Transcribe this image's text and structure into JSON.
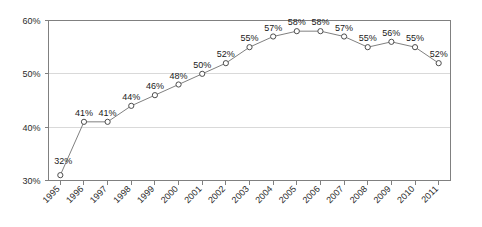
{
  "chart_data": {
    "type": "line",
    "title": "",
    "subtitle": "",
    "xlabel": "",
    "ylabel": "",
    "categories": [
      "1995",
      "1996",
      "1997",
      "1998",
      "1999",
      "2000",
      "2001",
      "2002",
      "2003",
      "2004",
      "2005",
      "2006",
      "2007",
      "2008",
      "2009",
      "2010",
      "2011"
    ],
    "values": [
      32,
      41,
      41,
      44,
      46,
      48,
      50,
      52,
      55,
      57,
      58,
      58,
      57,
      55,
      56,
      55,
      52
    ],
    "point_labels": [
      "32%",
      "41%",
      "41%",
      "44%",
      "46%",
      "48%",
      "50%",
      "52%",
      "55%",
      "57%",
      "58%",
      "58%",
      "57%",
      "55%",
      "56%",
      "55%",
      "52%"
    ],
    "plotted_values": [
      31,
      41,
      41,
      44,
      46,
      48,
      50,
      52,
      55,
      57,
      58,
      58,
      57,
      55,
      56,
      55,
      52
    ],
    "ylim": [
      30,
      60
    ],
    "yticks": [
      30,
      40,
      50,
      60
    ],
    "ytick_labels": [
      "30%",
      "40%",
      "50%",
      "60%"
    ],
    "grid": true,
    "legend": "none",
    "series": [
      {
        "name": "",
        "values": [
          32,
          41,
          41,
          44,
          46,
          48,
          50,
          52,
          55,
          57,
          58,
          58,
          57,
          55,
          56,
          55,
          52
        ],
        "line_color": "#808080",
        "marker": "open-circle",
        "marker_edge_color": "#555555",
        "marker_fill_color": "#ffffff"
      }
    ],
    "colors": {
      "axis": "#808080",
      "grid": "#d9d9d9",
      "line": "#808080",
      "marker_edge": "#4d4d4d",
      "text": "#2b2b2b",
      "background": "#ffffff"
    },
    "xtick_rotation": -45
  }
}
